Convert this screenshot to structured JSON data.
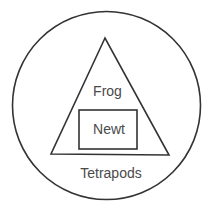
{
  "diagram": {
    "type": "nested-sets",
    "colors": {
      "stroke": "#333333",
      "text": "#4a4a4a",
      "background": "#ffffff"
    },
    "outer_set": {
      "shape": "circle",
      "label": "Tetrapods"
    },
    "middle_set": {
      "shape": "triangle",
      "label": "Frog"
    },
    "inner_set": {
      "shape": "rectangle",
      "label": "Newt"
    }
  }
}
